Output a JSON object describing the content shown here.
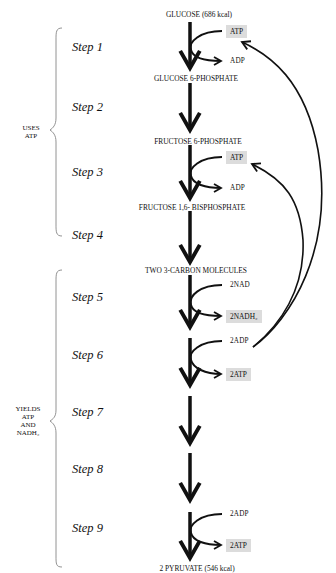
{
  "molecules": {
    "glucose": "GLUCOSE (686 kcal)",
    "g6p": "GLUCOSE 6-PHOSPHATE",
    "f6p": "FRUCTOSE 6-PHOSPHATE",
    "f16bp": "FRUCTOSE 1,6- BISPHOSPHATE",
    "three_carbon": "TWO 3-CARBON MOLECULES",
    "pyruvate": "2 PYRUVATE (546 kcal)"
  },
  "steps": [
    "Step 1",
    "Step 2",
    "Step 3",
    "Step 4",
    "Step 5",
    "Step 6",
    "Step 7",
    "Step 8",
    "Step 9"
  ],
  "side_labels": {
    "uses": [
      "USES",
      "ATP"
    ],
    "yields": [
      "YIELDS",
      "ATP",
      "AND",
      "NADH₂"
    ]
  },
  "reactions": {
    "step1_in": "ATP",
    "step1_out": "ADP",
    "step3_in": "ATP",
    "step3_out": "ADP",
    "step5_in": "2NAD",
    "step5_out": "2NADH₂",
    "step6_in": "2ADP",
    "step6_out": "2ATP",
    "step9_in": "2ADP",
    "step9_out": "2ATP"
  },
  "colors": {
    "box_fill": "#dcdcdc",
    "stroke": "#111111"
  }
}
